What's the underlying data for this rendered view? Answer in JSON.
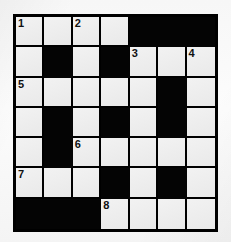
{
  "puzzle": {
    "type": "crossword-grid",
    "rows": 7,
    "columns": 7,
    "colors": {
      "paper": "#f7f7f7",
      "open_cell": "#eeeeee",
      "blocked_cell": "#040404",
      "grid_line": "#000000",
      "clue_number": "#111111"
    },
    "grid": [
      [
        {
          "state": "open",
          "number": "1"
        },
        {
          "state": "open",
          "number": ""
        },
        {
          "state": "open",
          "number": "2"
        },
        {
          "state": "open",
          "number": ""
        },
        {
          "state": "blocked",
          "number": ""
        },
        {
          "state": "blocked",
          "number": ""
        },
        {
          "state": "blocked",
          "number": ""
        }
      ],
      [
        {
          "state": "open",
          "number": ""
        },
        {
          "state": "blocked",
          "number": ""
        },
        {
          "state": "open",
          "number": ""
        },
        {
          "state": "blocked",
          "number": ""
        },
        {
          "state": "open",
          "number": "3"
        },
        {
          "state": "open",
          "number": ""
        },
        {
          "state": "open",
          "number": "4"
        }
      ],
      [
        {
          "state": "open",
          "number": "5"
        },
        {
          "state": "open",
          "number": ""
        },
        {
          "state": "open",
          "number": ""
        },
        {
          "state": "open",
          "number": ""
        },
        {
          "state": "open",
          "number": ""
        },
        {
          "state": "blocked",
          "number": ""
        },
        {
          "state": "open",
          "number": ""
        }
      ],
      [
        {
          "state": "open",
          "number": ""
        },
        {
          "state": "blocked",
          "number": ""
        },
        {
          "state": "open",
          "number": ""
        },
        {
          "state": "blocked",
          "number": ""
        },
        {
          "state": "open",
          "number": ""
        },
        {
          "state": "blocked",
          "number": ""
        },
        {
          "state": "open",
          "number": ""
        }
      ],
      [
        {
          "state": "open",
          "number": ""
        },
        {
          "state": "blocked",
          "number": ""
        },
        {
          "state": "open",
          "number": "6"
        },
        {
          "state": "open",
          "number": ""
        },
        {
          "state": "open",
          "number": ""
        },
        {
          "state": "open",
          "number": ""
        },
        {
          "state": "open",
          "number": ""
        }
      ],
      [
        {
          "state": "open",
          "number": "7"
        },
        {
          "state": "open",
          "number": ""
        },
        {
          "state": "open",
          "number": ""
        },
        {
          "state": "blocked",
          "number": ""
        },
        {
          "state": "open",
          "number": ""
        },
        {
          "state": "blocked",
          "number": ""
        },
        {
          "state": "open",
          "number": ""
        }
      ],
      [
        {
          "state": "blocked",
          "number": ""
        },
        {
          "state": "blocked",
          "number": ""
        },
        {
          "state": "blocked",
          "number": ""
        },
        {
          "state": "open",
          "number": "8"
        },
        {
          "state": "open",
          "number": ""
        },
        {
          "state": "open",
          "number": ""
        },
        {
          "state": "open",
          "number": ""
        }
      ]
    ]
  }
}
